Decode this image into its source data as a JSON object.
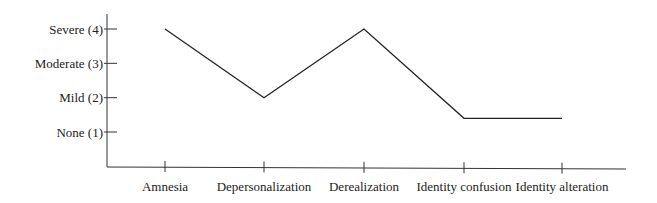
{
  "chart_data": {
    "type": "line",
    "title": "",
    "xlabel": "",
    "ylabel": "",
    "categories": [
      "Amnesia",
      "Depersonalization",
      "Derealization",
      "Identity confusion",
      "Identity alteration"
    ],
    "series": [
      {
        "name": "Severity",
        "values": [
          4,
          2,
          4,
          1.4,
          1.4
        ]
      }
    ],
    "y_ticks": [
      {
        "value": 4,
        "label": "Severe (4)"
      },
      {
        "value": 3,
        "label": "Moderate (3)"
      },
      {
        "value": 2,
        "label": "Mild (2)"
      },
      {
        "value": 1,
        "label": "None (1)"
      }
    ],
    "ylim": [
      0,
      4.4
    ],
    "grid": false,
    "legend": "none",
    "colors": {
      "line": "#222222",
      "axis": "#333333"
    }
  }
}
